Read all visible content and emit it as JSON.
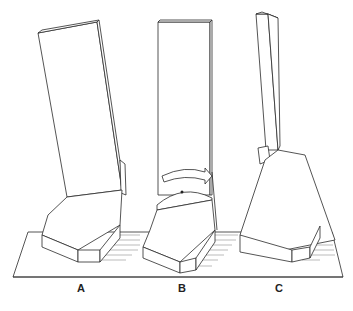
{
  "figure": {
    "type": "technical illustration",
    "panels": [
      {
        "id": "A",
        "label": "A",
        "description": "Tall board tilted leaning backward on wedge base"
      },
      {
        "id": "B",
        "label": "B",
        "description": "Board upright with curved rotation arrow around pivot"
      },
      {
        "id": "C",
        "label": "C",
        "description": "Board lifted off with hinge mechanism, base block tilted"
      }
    ]
  }
}
